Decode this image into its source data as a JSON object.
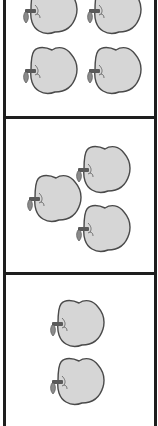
{
  "worksheet": {
    "panels": [
      {
        "name": "panel-1",
        "apple_count": 4,
        "apples": [
          {
            "x": 22,
            "y": -15
          },
          {
            "x": 86,
            "y": -15
          },
          {
            "x": 22,
            "y": 45
          },
          {
            "x": 86,
            "y": 45
          }
        ]
      },
      {
        "name": "panel-2",
        "apple_count": 3,
        "apples": [
          {
            "x": 75,
            "y": 144
          },
          {
            "x": 26,
            "y": 173
          },
          {
            "x": 75,
            "y": 203
          }
        ]
      },
      {
        "name": "panel-3",
        "apple_count": 2,
        "apples": [
          {
            "x": 49,
            "y": 298
          },
          {
            "x": 49,
            "y": 356
          }
        ]
      }
    ],
    "colors": {
      "border": "#1e1e1e",
      "apple_fill": "#d6d6d6",
      "apple_outline": "#4a4a4a",
      "stem": "#5a5a5a",
      "background": "#ffffff"
    }
  }
}
